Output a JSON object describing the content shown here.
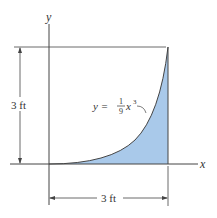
{
  "figure": {
    "x_axis_label": "x",
    "y_axis_label": "y",
    "height_dimension": "3 ft",
    "width_dimension": "3 ft",
    "curve_label": {
      "lhs": "y =",
      "numerator": "1",
      "denominator": "9",
      "variable": "x",
      "exponent": "3"
    },
    "fill_color": "#a9c9ea",
    "line_color": "#333333"
  }
}
